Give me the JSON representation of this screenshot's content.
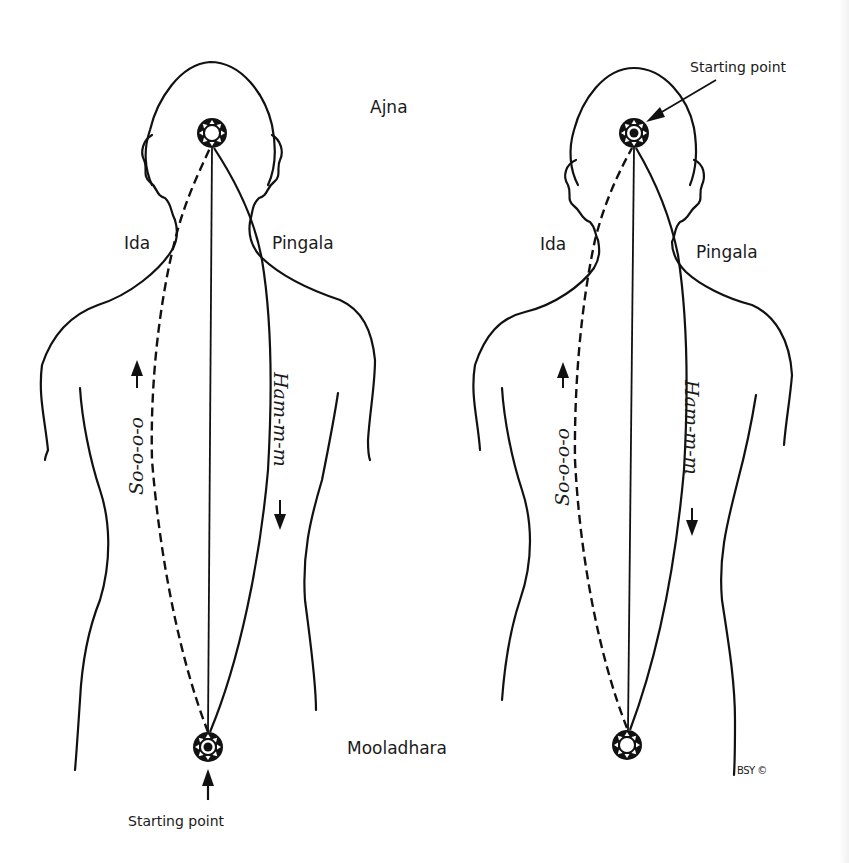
{
  "diagram": {
    "colors": {
      "ink": "#111111",
      "paper": "#ffffff"
    },
    "left_figure": {
      "top_chakra": "Ajna",
      "ida_label": "Ida",
      "pingala_label": "Pingala",
      "ascending_mantra": "So-o-o-o",
      "descending_mantra": "Ham-m-m",
      "bottom_chakra": "Mooladhara",
      "starting_point_label": "Starting point",
      "starting_point_location": "Mooladhara"
    },
    "right_figure": {
      "ida_label": "Ida",
      "pingala_label": "Pingala",
      "ascending_mantra": "So-o-o-o",
      "descending_mantra": "Ham-m-m",
      "starting_point_label": "Starting point",
      "starting_point_location": "Ajna"
    },
    "credit": "BSY ©",
    "icons": {
      "chakra": "chakra-lotus-icon",
      "arrow": "arrow-icon"
    }
  }
}
